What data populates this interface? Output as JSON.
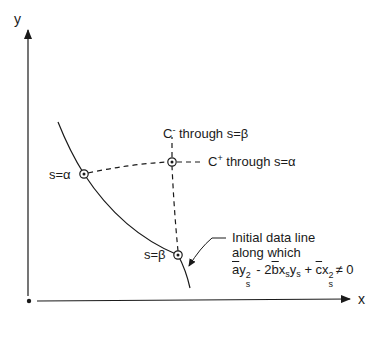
{
  "axes": {
    "x_label": "x",
    "y_label": "y"
  },
  "points": {
    "alpha": {
      "label": "s=α",
      "x": 84,
      "y": 174
    },
    "intersection": {
      "x": 172,
      "y": 162
    },
    "beta": {
      "label": "s=β",
      "x": 178,
      "y": 255
    }
  },
  "characteristics": {
    "c_minus": {
      "base": "C",
      "sign": "-",
      "text": " through s=β"
    },
    "c_plus": {
      "base": "C",
      "sign": "+",
      "text": " through s=α"
    }
  },
  "annotation": {
    "line1": "Initial data line",
    "line2": "along which",
    "equation": {
      "a": "a",
      "y": "y",
      "sq": "2",
      "s": "s",
      "minus2b": " - 2",
      "b": "b",
      "x": "x",
      "ys": "y",
      "plus": " + ",
      "c": "c",
      "x2": "x",
      "neq": "≠ 0"
    }
  },
  "colors": {
    "ink": "#1a1a1a",
    "background": "#ffffff"
  }
}
